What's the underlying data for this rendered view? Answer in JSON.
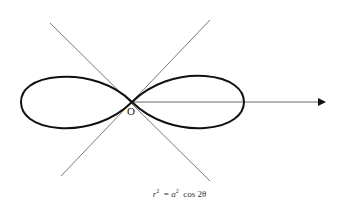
{
  "diagram": {
    "origin_label": "O",
    "equation": {
      "lhs_var": "r",
      "lhs_exp": "2",
      "equals": "=",
      "rhs_coef": "a",
      "rhs_exp": "2",
      "rhs_func": "cos 2θ"
    },
    "elements": {
      "curve": "lemniscate",
      "asymptote_lines": 2,
      "polar_axis": "arrow pointing right from origin"
    },
    "colors": {
      "curve": "#111111",
      "lines": "#555555",
      "background": "#ffffff"
    }
  }
}
